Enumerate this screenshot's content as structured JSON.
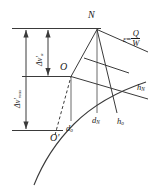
{
  "figure": {
    "type": "engineering-line-diagram",
    "background_color": "#ffffff",
    "stroke_color": "#3a3a3a",
    "text_color": "#1a1a1a",
    "points": {
      "N": "N",
      "O": "O",
      "O_prime": "O'"
    },
    "dimension_labels": {
      "delta_v_max": {
        "symbol": "Δv'",
        "subscript": "max"
      },
      "delta_v_a": {
        "symbol": "Δv'",
        "subscript": "a"
      }
    },
    "axis_labels": {
      "d_o": {
        "symbol": "d",
        "subscript": "o"
      },
      "d_N": {
        "symbol": "d",
        "subscript": "N"
      },
      "h_o": {
        "symbol": "h",
        "subscript": "o"
      },
      "h_N": {
        "symbol": "h",
        "subscript": "N"
      }
    },
    "formula": {
      "lhs": "ε",
      "operator": "=",
      "numerator": "Q",
      "denominator": "W"
    }
  }
}
